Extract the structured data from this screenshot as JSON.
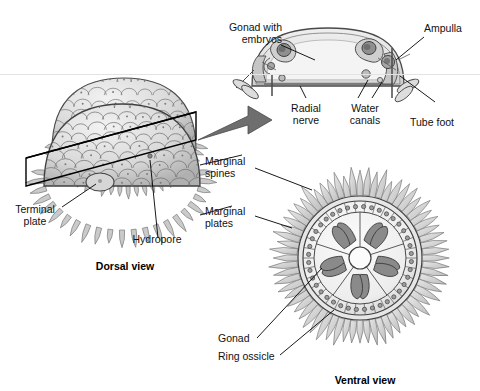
{
  "figure": {
    "background_color": "#ffffff",
    "ink_color": "#3a3a3a",
    "fill_light": "#dcdcdc",
    "fill_mid": "#b4b4b4",
    "fill_dark": "#8a8a8a",
    "arrow_color": "#6e6e6e"
  },
  "labels": {
    "gonad_with_embryos": "Gonad with\nembryos",
    "ampulla": "Ampulla",
    "radial_nerve": "Radial\nnerve",
    "water_canals": "Water\ncanals",
    "tube_foot": "Tube foot",
    "marginal_spines": "Marginal\nspines",
    "marginal_plates": "Marginal\nplates",
    "terminal_plate": "Terminal\nplate",
    "hydropore": "Hydropore",
    "gonad": "Gonad",
    "ring_ossicle": "Ring ossicle"
  },
  "captions": {
    "dorsal": "Dorsal view",
    "ventral": "Ventral view"
  },
  "views": {
    "cross_section": {
      "name": "sagittal-cross-section",
      "center_x": 328,
      "center_y": 58,
      "width": 156,
      "height": 56
    },
    "dorsal": {
      "name": "dorsal-test-dome",
      "center_x": 122,
      "center_y": 170,
      "radius_x": 78,
      "radius_y": 60,
      "spine_count": 46,
      "plate_rows": 9
    },
    "ventral": {
      "name": "ventral-disc",
      "center_x": 360,
      "center_y": 258,
      "spine_outer_radius": 88,
      "ring_radius": 58,
      "central_disc_radius": 11,
      "gonad_count": 10,
      "ossicle_bead_count": 40,
      "spine_count": 64
    },
    "section_plane": {
      "name": "cutting-plane",
      "x1": 26,
      "y1": 185,
      "x2": 196,
      "y2": 112
    },
    "transfer_arrow": {
      "name": "view-transfer-arrow",
      "from_x": 196,
      "from_y": 132,
      "to_x": 268,
      "to_y": 106
    }
  },
  "scan_artifact": {
    "line_y": 74,
    "color": "#e3e3e3"
  }
}
